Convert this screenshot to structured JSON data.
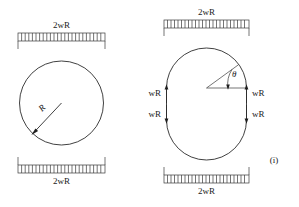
{
  "figure": {
    "caption": "(i)",
    "panels": [
      {
        "id": "circular-ring",
        "shape": "circle",
        "radius_label": "R",
        "top_load_label": "2wR",
        "bottom_load_label": "2wR"
      },
      {
        "id": "stadium-ring",
        "shape": "stadium",
        "angle_label": "θ",
        "top_load_label": "2wR",
        "bottom_load_label": "2wR",
        "forces": [
          {
            "position": "upper-left",
            "label": "wR",
            "direction": "up"
          },
          {
            "position": "upper-right",
            "label": "wR",
            "direction": "up"
          },
          {
            "position": "lower-left",
            "label": "wR",
            "direction": "down"
          },
          {
            "position": "lower-right",
            "label": "wR",
            "direction": "down"
          }
        ]
      }
    ]
  },
  "colors": {
    "stroke": "#2b2b2b",
    "background": "#ffffff",
    "text": "#1a1a1a"
  }
}
